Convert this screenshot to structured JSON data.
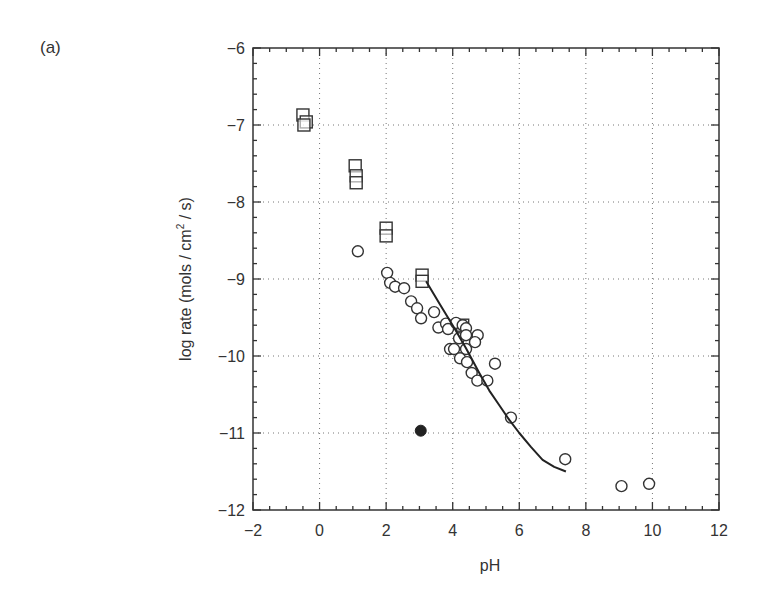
{
  "figure": {
    "panel_label": "(a)",
    "xlabel": "pH",
    "ylabel_prefix": "log rate (mols / cm",
    "ylabel_sup": "2",
    "ylabel_suffix": " / s)"
  },
  "chart_data": {
    "type": "scatter",
    "title": "",
    "panel": "(a)",
    "xlabel": "pH",
    "ylabel": "log rate (mols / cm^2 / s)",
    "xlim": [
      -2,
      12
    ],
    "ylim": [
      -12,
      -6
    ],
    "xticks": [
      -2,
      0,
      2,
      4,
      6,
      8,
      10,
      12
    ],
    "yticks": [
      -12,
      -11,
      -10,
      -9,
      -8,
      -7,
      -6
    ],
    "xtick_labels": [
      "−2",
      "0",
      "2",
      "4",
      "6",
      "8",
      "10",
      "12"
    ],
    "ytick_labels": [
      "−12",
      "−11",
      "−10",
      "−9",
      "−8",
      "−7",
      "−6"
    ],
    "grid": "dotted",
    "legend": null,
    "series": [
      {
        "name": "open squares",
        "marker": "square-open",
        "points": [
          [
            -0.5,
            -6.87
          ],
          [
            -0.4,
            -6.96
          ],
          [
            -0.47,
            -7.0
          ],
          [
            1.07,
            -7.53
          ],
          [
            1.1,
            -7.66
          ],
          [
            1.1,
            -7.75
          ],
          [
            2.0,
            -8.34
          ],
          [
            2.0,
            -8.44
          ],
          [
            3.08,
            -8.95
          ],
          [
            3.08,
            -9.03
          ],
          [
            4.3,
            -9.6
          ]
        ]
      },
      {
        "name": "open circles",
        "marker": "circle-open",
        "points": [
          [
            1.15,
            -8.64
          ],
          [
            2.03,
            -8.92
          ],
          [
            2.12,
            -9.05
          ],
          [
            2.27,
            -9.1
          ],
          [
            2.54,
            -9.12
          ],
          [
            2.75,
            -9.29
          ],
          [
            2.93,
            -9.38
          ],
          [
            3.05,
            -9.51
          ],
          [
            3.44,
            -9.43
          ],
          [
            3.57,
            -9.63
          ],
          [
            3.8,
            -9.58
          ],
          [
            3.86,
            -9.65
          ],
          [
            4.1,
            -9.57
          ],
          [
            4.3,
            -9.6
          ],
          [
            4.4,
            -9.64
          ],
          [
            4.19,
            -9.77
          ],
          [
            4.4,
            -9.73
          ],
          [
            4.75,
            -9.73
          ],
          [
            4.67,
            -9.82
          ],
          [
            3.92,
            -9.91
          ],
          [
            4.04,
            -9.91
          ],
          [
            4.4,
            -9.91
          ],
          [
            4.22,
            -10.03
          ],
          [
            4.43,
            -10.08
          ],
          [
            4.57,
            -10.22
          ],
          [
            4.74,
            -10.32
          ],
          [
            5.04,
            -10.32
          ],
          [
            5.27,
            -10.1
          ],
          [
            5.75,
            -10.8
          ],
          [
            7.38,
            -11.34
          ],
          [
            9.07,
            -11.69
          ],
          [
            9.9,
            -11.66
          ]
        ]
      },
      {
        "name": "filled circle",
        "marker": "circle-filled",
        "points": [
          [
            3.04,
            -10.97
          ]
        ]
      },
      {
        "name": "fit curve",
        "marker": "line",
        "points": [
          [
            3.2,
            -9.03
          ],
          [
            3.6,
            -9.32
          ],
          [
            4.04,
            -9.63
          ],
          [
            4.4,
            -9.9
          ],
          [
            4.8,
            -10.22
          ],
          [
            5.1,
            -10.45
          ],
          [
            5.4,
            -10.64
          ],
          [
            5.7,
            -10.83
          ],
          [
            6.0,
            -11.0
          ],
          [
            6.35,
            -11.18
          ],
          [
            6.7,
            -11.35
          ],
          [
            7.05,
            -11.44
          ],
          [
            7.4,
            -11.5
          ]
        ]
      }
    ]
  }
}
